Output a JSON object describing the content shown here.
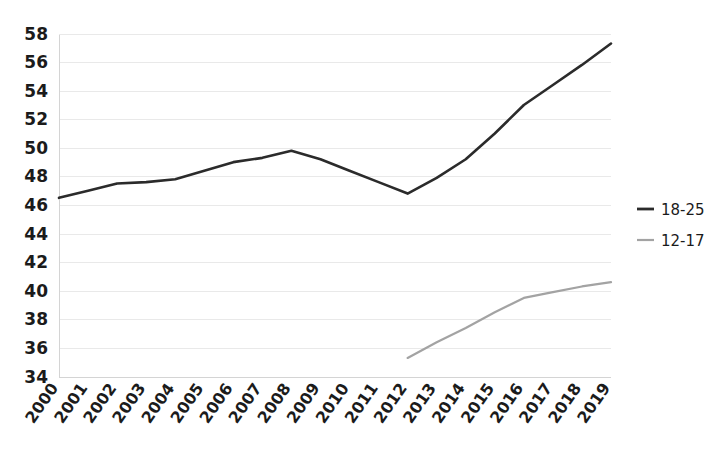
{
  "chart_data": {
    "type": "line",
    "title": "",
    "subtitle": "",
    "xlabel": "",
    "ylabel": "",
    "categories": [
      "2000",
      "2001",
      "2002",
      "2003",
      "2004",
      "2005",
      "2006",
      "2007",
      "2008",
      "2009",
      "2010",
      "2011",
      "2012",
      "2013",
      "2014",
      "2015",
      "2016",
      "2017",
      "2018",
      "2019"
    ],
    "ylim": [
      34,
      58
    ],
    "ytick_labels": [
      "58",
      "56",
      "54",
      "52",
      "50",
      "48",
      "46",
      "44",
      "42",
      "40",
      "38",
      "36",
      "34"
    ],
    "ytick_values": [
      58,
      56,
      54,
      52,
      50,
      48,
      46,
      44,
      42,
      40,
      38,
      36,
      34
    ],
    "grid": true,
    "grid_axis": "y",
    "legend_position": "right",
    "series": [
      {
        "name": "18-25",
        "color": "#2b2b2b",
        "width": 2.6,
        "values": [
          46.5,
          47.0,
          47.5,
          47.6,
          47.8,
          48.4,
          49.0,
          49.3,
          49.8,
          49.2,
          48.4,
          47.6,
          46.8,
          47.9,
          49.2,
          51.0,
          53.0,
          54.4,
          55.8,
          57.3
        ]
      },
      {
        "name": "12-17",
        "color": "#a3a3a3",
        "width": 2.2,
        "values": [
          null,
          null,
          null,
          null,
          null,
          null,
          null,
          null,
          null,
          null,
          null,
          null,
          35.3,
          36.4,
          37.4,
          38.5,
          39.5,
          39.9,
          40.3,
          40.6
        ]
      }
    ]
  },
  "legend": {
    "items": [
      {
        "label": "18-25",
        "color": "#2b2b2b"
      },
      {
        "label": "12-17",
        "color": "#a3a3a3"
      }
    ]
  }
}
